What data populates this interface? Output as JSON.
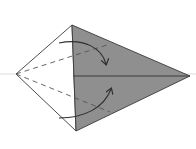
{
  "diagram": {
    "type": "origami-fold-step",
    "colors": {
      "background": "#ffffff",
      "shaded_face": "#8f8f8f",
      "outline": "#3a3a3a",
      "reference_line": "#d4d4d4",
      "dashed_line": "#555555",
      "arrow": "#2f2f2f"
    },
    "points": {
      "left": [
        16,
        74
      ],
      "top": [
        72,
        25
      ],
      "bottom": [
        76,
        131
      ],
      "right": [
        190,
        76
      ]
    },
    "annotations": {
      "upper_arrow": "fold-down",
      "lower_arrow": "fold-up",
      "dashed_lines": [
        "valley-fold-upper",
        "valley-fold-lower"
      ]
    }
  }
}
